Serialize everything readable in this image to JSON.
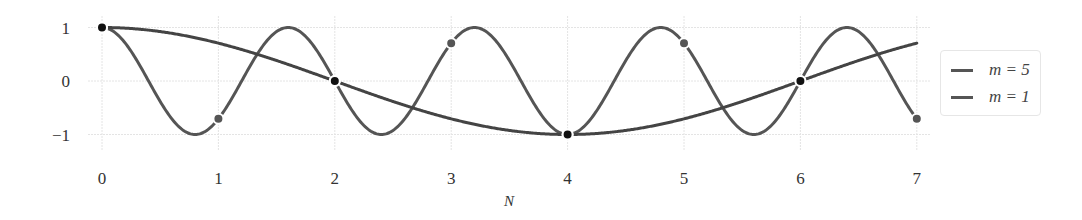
{
  "chart_data": {
    "type": "line",
    "title": "",
    "xlabel": "N",
    "ylabel": "",
    "xlim": [
      0,
      7
    ],
    "ylim": [
      -1,
      1
    ],
    "grid": true,
    "legend_position": "right",
    "x_ticks": [
      "0",
      "1",
      "2",
      "3",
      "4",
      "5",
      "6",
      "7"
    ],
    "y_ticks": [
      "1",
      "0",
      "−1"
    ],
    "series": [
      {
        "name": "m = 5",
        "function": "cos(5*pi*N/4)",
        "x": [
          0,
          1,
          2,
          3,
          4,
          5,
          6,
          7
        ],
        "values": [
          1,
          -0.707,
          0,
          0.707,
          -1,
          0.707,
          0,
          -0.707
        ],
        "color": "#555555",
        "marker_color": "#555555"
      },
      {
        "name": "m = 1",
        "function": "cos(pi*N/4)",
        "x": [
          0,
          1,
          2,
          3,
          4,
          5,
          6,
          7
        ],
        "values": [
          1,
          0.707,
          0,
          -0.707,
          -1,
          -0.707,
          0,
          0.707
        ],
        "color": "#444444",
        "sampled_markers_at": [
          0,
          2,
          4,
          6
        ],
        "marker_color": "#111111"
      }
    ]
  },
  "legend": {
    "items": [
      {
        "label": "m = 5"
      },
      {
        "label": "m = 1"
      }
    ]
  }
}
